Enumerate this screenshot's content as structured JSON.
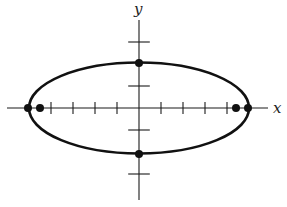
{
  "diagram": {
    "axes": {
      "x_label": "x",
      "y_label": "y",
      "origin_px": [
        139,
        108
      ],
      "x_range_px": [
        7,
        268
      ],
      "y_range_px": [
        20,
        200
      ],
      "tick_spacing_px": 22,
      "x_ticks_units": [
        -4,
        -3,
        -2,
        -1,
        1,
        2,
        3,
        4
      ],
      "y_ticks_units": [
        -3,
        -1,
        1,
        3
      ],
      "tick_half_len_px": 6
    },
    "ellipse": {
      "center_px": [
        139,
        108
      ],
      "rx_px": 110,
      "ry_px": 45.5,
      "stroke_color": "#111111"
    },
    "points": [
      {
        "name": "left-vertex",
        "px": [
          28,
          108
        ]
      },
      {
        "name": "right-vertex",
        "px": [
          248,
          108
        ]
      },
      {
        "name": "left-focus",
        "px": [
          40,
          108
        ]
      },
      {
        "name": "right-focus",
        "px": [
          236,
          108
        ]
      },
      {
        "name": "top-co-vertex",
        "px": [
          139,
          63
        ]
      },
      {
        "name": "bottom-co-vertex",
        "px": [
          139,
          154
        ]
      }
    ]
  }
}
